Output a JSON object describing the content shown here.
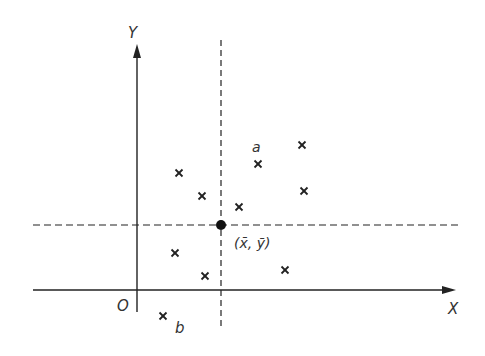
{
  "labels": {
    "y_axis": "Y",
    "x_axis": "X",
    "origin": "O",
    "mean_point": "(x̄, ȳ)",
    "point_a": "a",
    "point_b": "b"
  },
  "colors": {
    "ink": "#222222",
    "background": "#ffffff"
  },
  "points": [
    {
      "x": 179,
      "y": 173
    },
    {
      "x": 202,
      "y": 196
    },
    {
      "x": 239,
      "y": 207
    },
    {
      "x": 258,
      "y": 164
    },
    {
      "x": 302,
      "y": 145
    },
    {
      "x": 304,
      "y": 191
    },
    {
      "x": 175,
      "y": 253
    },
    {
      "x": 205,
      "y": 276
    },
    {
      "x": 285,
      "y": 270
    },
    {
      "x": 163,
      "y": 316
    }
  ],
  "mean": {
    "x": 221,
    "y": 225
  }
}
